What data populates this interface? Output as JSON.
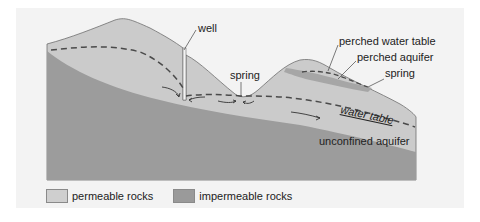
{
  "diagram": {
    "type": "groundwater cross-section",
    "labels": {
      "well": "well",
      "spring_valley": "spring",
      "perched_water_table": "perched water table",
      "perched_aquifer": "perched aquifer",
      "spring_hill": "spring",
      "water_table": "water table",
      "unconfined_aquifer": "unconfined aquifer"
    },
    "colors": {
      "background_panel": "#f3f3f3",
      "permeable": "#c9c9c9",
      "permeable_top": "#d4d4d4",
      "impermeable": "#9a9a9a",
      "perched_layer": "#a8a8a8",
      "outline": "#6e6e6e",
      "water_table_dash": "#4a4a4a"
    }
  },
  "legend": {
    "items": [
      {
        "label": "permeable rocks",
        "color": "#cfcfcf"
      },
      {
        "label": "impermeable rocks",
        "color": "#9a9a9a"
      }
    ]
  }
}
